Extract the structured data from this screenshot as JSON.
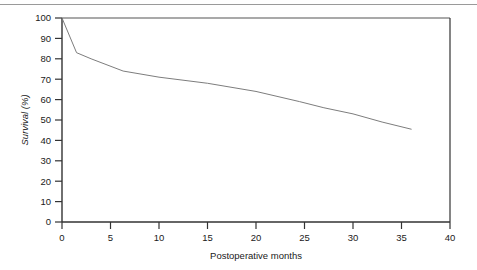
{
  "figure": {
    "top_rule_color": "#9a9a9a",
    "background_color": "#ffffff"
  },
  "chart_data": {
    "type": "line",
    "title": "",
    "subtitle": "",
    "xlabel": "Postoperative months",
    "ylabel": "Survival (%)",
    "xlim": [
      0,
      40
    ],
    "ylim": [
      0,
      100
    ],
    "xticks": [
      0,
      5,
      10,
      15,
      20,
      25,
      30,
      35,
      40
    ],
    "xtick_labels": [
      "0",
      "5",
      "10",
      "15",
      "20",
      "25",
      "30",
      "35",
      "40"
    ],
    "yticks": [
      0,
      10,
      20,
      30,
      40,
      50,
      60,
      70,
      80,
      90,
      100
    ],
    "ytick_labels": [
      "0",
      "10",
      "20",
      "30",
      "40",
      "50",
      "60",
      "70",
      "80",
      "90",
      "100"
    ],
    "grid": false,
    "legend": "none",
    "axis_color": "#333333",
    "frame": [
      "left",
      "bottom",
      "top",
      "right"
    ],
    "series": [
      {
        "name": "Survival",
        "color": "#7d7d7d",
        "line_width": 1,
        "x": [
          0,
          1.5,
          3.0,
          6.3,
          10.0,
          15.0,
          20.0,
          24.5,
          27.0,
          30.0,
          33.0,
          36.0
        ],
        "values": [
          100,
          83,
          80,
          74,
          71,
          68,
          64,
          59,
          56,
          53,
          49,
          45.5
        ]
      }
    ]
  }
}
